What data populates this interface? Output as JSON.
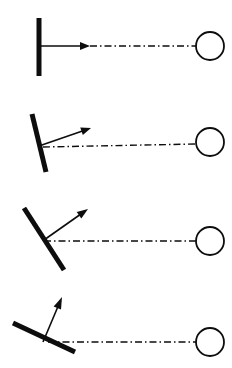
{
  "figure": {
    "width": 232,
    "height": 368,
    "background_color": "#ffffff",
    "ink_color": "#0d0d0d",
    "panel_count": 4
  },
  "style": {
    "mirror_stroke_width": 5,
    "ray_stroke_width": 1.6,
    "axis_stroke_width": 1.4,
    "circle_stroke_width": 1.8,
    "axis_dash_pattern": "7 3 1.5 3",
    "circle_radius": 14
  },
  "panels": [
    {
      "index": 1,
      "name": "panel-zero-tilt",
      "label": "Mirror vertical, ray horizontal",
      "mirror": {
        "name": "mirror-bar",
        "tilt_deg_from_vertical": 0,
        "x1": 39,
        "y1": 18,
        "x2": 39,
        "y2": 76,
        "length": 58
      },
      "ray": {
        "name": "reflected-ray-arrow",
        "angle_deg_above_horizontal": 0,
        "x1": 39,
        "y1": 46,
        "x2": 90,
        "y2": 46,
        "head_length": 10,
        "head_width": 8
      },
      "axis": {
        "name": "optical-axis",
        "x1": 90,
        "y1": 46,
        "x2": 196,
        "y2": 46
      },
      "target": {
        "name": "target-circle",
        "cx": 210,
        "cy": 46,
        "r": 14
      }
    },
    {
      "index": 2,
      "name": "panel-small-tilt",
      "label": "Mirror tilted slightly, ray raised slightly",
      "mirror": {
        "name": "mirror-bar",
        "tilt_deg_from_vertical": 12,
        "x1": 32,
        "y1": 114,
        "x2": 46,
        "y2": 172,
        "length": 60
      },
      "ray": {
        "name": "reflected-ray-arrow",
        "angle_deg_above_horizontal": 20,
        "x1": 39,
        "y1": 146,
        "x2": 91,
        "y2": 128,
        "head_length": 10,
        "head_width": 8
      },
      "axis": {
        "name": "optical-axis",
        "x1": 43,
        "y1": 147,
        "x2": 196,
        "y2": 144
      },
      "target": {
        "name": "target-circle",
        "cx": 210,
        "cy": 142,
        "r": 14
      }
    },
    {
      "index": 3,
      "name": "panel-medium-tilt",
      "label": "Mirror at forty-five degrees, ray at forty-five degrees",
      "mirror": {
        "name": "mirror-bar",
        "tilt_deg_from_vertical": 42,
        "x1": 24,
        "y1": 208,
        "x2": 64,
        "y2": 270,
        "length": 74
      },
      "ray": {
        "name": "reflected-ray-arrow",
        "angle_deg_above_horizontal": 48,
        "x1": 44,
        "y1": 240,
        "x2": 88,
        "y2": 209,
        "head_length": 11,
        "head_width": 8
      },
      "axis": {
        "name": "optical-axis",
        "x1": 44,
        "y1": 241,
        "x2": 196,
        "y2": 241
      },
      "target": {
        "name": "target-circle",
        "cx": 210,
        "cy": 241,
        "r": 14
      }
    },
    {
      "index": 4,
      "name": "panel-large-tilt",
      "label": "Mirror nearly horizontal, ray nearly vertical",
      "mirror": {
        "name": "mirror-bar",
        "tilt_deg_from_vertical": 73,
        "x1": 13,
        "y1": 323,
        "x2": 75,
        "y2": 352,
        "length": 68
      },
      "ray": {
        "name": "reflected-ray-arrow",
        "angle_deg_above_horizontal": 76,
        "x1": 43,
        "y1": 342,
        "x2": 62,
        "y2": 297,
        "head_length": 12,
        "head_width": 8
      },
      "axis": {
        "name": "optical-axis",
        "x1": 48,
        "y1": 342,
        "x2": 196,
        "y2": 342
      },
      "target": {
        "name": "target-circle",
        "cx": 210,
        "cy": 342,
        "r": 14
      }
    }
  ]
}
